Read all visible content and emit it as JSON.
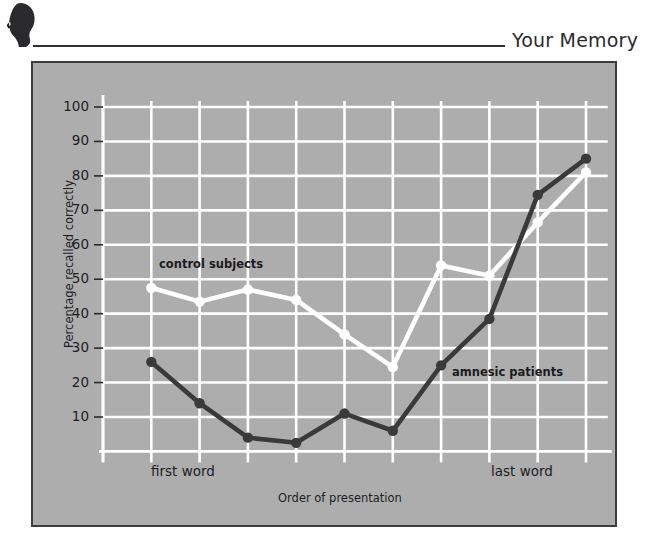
{
  "header": {
    "title": "Your Memory",
    "icon": "head-silhouette-icon"
  },
  "figure": {
    "background_color": "#adadad",
    "border_color": "#3c3c3c",
    "grid_color": "#ffffff"
  },
  "chart_data": {
    "type": "line",
    "title": "",
    "xlabel": "Order of presentation",
    "ylabel": "Percentage recalled correctly",
    "x_axis_end_labels": {
      "left": "first word",
      "right": "last word"
    },
    "x": [
      1,
      2,
      3,
      4,
      5,
      6,
      7,
      8,
      9,
      10
    ],
    "ylim": [
      0,
      100
    ],
    "yticks": [
      10,
      20,
      30,
      40,
      50,
      60,
      70,
      80,
      90,
      100
    ],
    "ytick_labels": [
      "10",
      "20",
      "30",
      "40",
      "50",
      "60",
      "70",
      "80",
      "90",
      "100"
    ],
    "grid": true,
    "legend_position": "inline-annotations",
    "series": [
      {
        "name": "control subjects",
        "color": "#ffffff",
        "marker": "circle",
        "values": [
          47.5,
          43.5,
          47,
          44,
          34,
          24.5,
          54,
          51,
          66.5,
          81
        ]
      },
      {
        "name": "amnesic patients",
        "color": "#3a3a3c",
        "marker": "circle",
        "values": [
          26,
          14,
          4,
          2.5,
          11,
          6,
          25,
          38.5,
          74.5,
          85
        ]
      }
    ],
    "annotations": [
      {
        "text": "control subjects",
        "series": "control subjects"
      },
      {
        "text": "amnesic patients",
        "series": "amnesic patients"
      }
    ]
  }
}
